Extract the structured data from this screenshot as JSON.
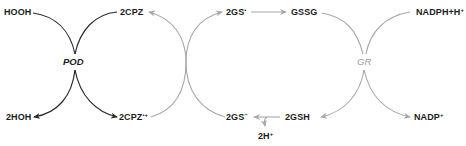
{
  "colors": {
    "dark": "#2a2a2a",
    "gray": "#a8a8a8",
    "text": "#1c1c1c",
    "enzyme_gray": "#9a9a9a"
  },
  "enzymes": {
    "pod": "POD",
    "gr": "GR"
  },
  "species": {
    "hooh": {
      "text": "HOOH",
      "sup": ""
    },
    "twohoh": {
      "text": "2HOH",
      "sup": ""
    },
    "cpz": {
      "text": "2CPZ",
      "sup": ""
    },
    "cpz_radical": {
      "text": "2CPZ",
      "sup": "•+"
    },
    "gs_radical": {
      "text": "2GS",
      "sup": "•"
    },
    "gssg": {
      "text": "GSSG",
      "sup": ""
    },
    "nadph": {
      "text": "NADPH+H",
      "sup": "+"
    },
    "gs_anion": {
      "text": "2GS",
      "sup": "−"
    },
    "gsh": {
      "text": "2GSH",
      "sup": ""
    },
    "nadp": {
      "text": "NADP",
      "sup": "+"
    },
    "protons": {
      "text": "2H",
      "sup": "+"
    }
  }
}
